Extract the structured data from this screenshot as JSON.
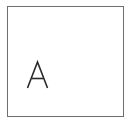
{
  "card": {
    "label": "A",
    "border_color": "#6e6e6e",
    "text_color": "#2a2a2a"
  }
}
